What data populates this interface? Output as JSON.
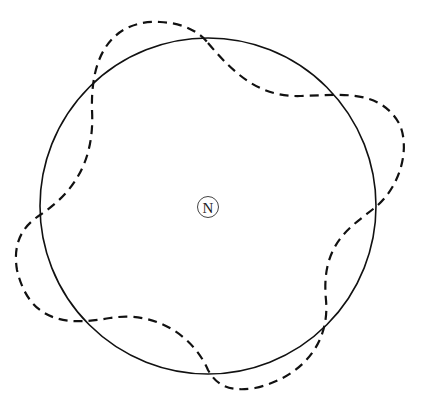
{
  "caption": "",
  "diagram": {
    "center_label": "N",
    "center": [
      208,
      208
    ],
    "circle_radius": 168,
    "solid_color": "#111111",
    "dashed_color": "#111111"
  }
}
